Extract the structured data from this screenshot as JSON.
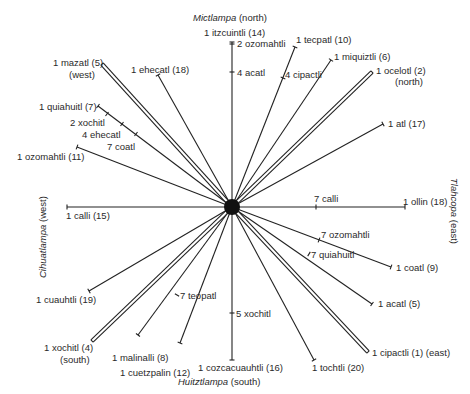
{
  "directions": {
    "north": {
      "name": "Mictlampa",
      "suffix": "(north)"
    },
    "south": {
      "name": "Huitztlampa",
      "suffix": "(south)"
    },
    "west": {
      "name": "Cihuatlampa",
      "suffix": "(west)"
    },
    "east": {
      "name": "Tlahcopa",
      "suffix": "(east)"
    }
  },
  "center": {
    "x": 232,
    "y": 207
  },
  "rays": [
    {
      "label": "1 itzcuintli (14)",
      "end": [
        232,
        42
      ],
      "double": false
    },
    {
      "label": "1 tecpatl (10)",
      "end": [
        295,
        47
      ],
      "double": false
    },
    {
      "label": "1 miquiztli (6)",
      "end": [
        331,
        60
      ],
      "double": false
    },
    {
      "label": "1 ocelotl (2)",
      "sub": "(north)",
      "end": [
        372,
        72
      ],
      "double": true
    },
    {
      "label": "1 atl (17)",
      "end": [
        383,
        124
      ],
      "double": false
    },
    {
      "label": "1 ollin (18)",
      "end": [
        405,
        207
      ],
      "double": false
    },
    {
      "label": "1 coatl (9)",
      "end": [
        391,
        267
      ],
      "double": false
    },
    {
      "label": "1 acatl (5)",
      "end": [
        372,
        304
      ],
      "double": false
    },
    {
      "label": "1 cipactli (1) (east)",
      "end": [
        368,
        352
      ],
      "double": true
    },
    {
      "label": "1 tochtli (20)",
      "end": [
        314,
        360
      ],
      "double": false
    },
    {
      "label": "1 cozcacuauhtli (16)",
      "end": [
        232,
        360
      ],
      "double": false
    },
    {
      "label": "1 cuetzpalin (12)",
      "end": [
        180,
        343
      ],
      "double": false
    },
    {
      "label": "1 malinalli (8)",
      "end": [
        138,
        335
      ],
      "double": false
    },
    {
      "label": "1 xochitl (4)",
      "sub": "(south)",
      "end": [
        92,
        341
      ],
      "double": true
    },
    {
      "label": "1 cuauhtli (19)",
      "end": [
        89,
        291
      ],
      "double": false
    },
    {
      "label": "1 calli (15)",
      "end": [
        67,
        207
      ],
      "double": false
    },
    {
      "label": "1 ozomahtli (11)",
      "end": [
        77,
        147
      ],
      "double": false
    },
    {
      "label": "1 quiahuitl (7)",
      "end": [
        98,
        106
      ],
      "double": false
    },
    {
      "label": "1 mazatl (5)",
      "sub": "(west)",
      "end": [
        102,
        64
      ],
      "double": true
    },
    {
      "label": "1 ehecatl (18)",
      "end": [
        158,
        75
      ],
      "double": false
    }
  ],
  "ticks": [
    {
      "label": "2 ozomahtli",
      "at": [
        232,
        44
      ]
    },
    {
      "label": "4 acatl",
      "at": [
        232,
        72
      ]
    },
    {
      "label": "4 cipactli",
      "at": [
        283,
        78
      ]
    },
    {
      "label": "7 calli",
      "at": [
        316,
        207
      ]
    },
    {
      "label": "7 ozomahtli",
      "at": [
        319,
        240
      ]
    },
    {
      "label": "7 quiahuitl",
      "at": [
        309,
        254
      ]
    },
    {
      "label": "5 xochitl",
      "at": [
        232,
        313
      ]
    },
    {
      "label": "7 teopatl",
      "at": [
        177,
        295
      ]
    },
    {
      "label": "2 xochitl",
      "at": [
        107,
        114
      ]
    },
    {
      "label": "4 ehecatl",
      "at": [
        122,
        124
      ]
    },
    {
      "label": "7 coatl",
      "at": [
        136,
        134
      ]
    }
  ]
}
